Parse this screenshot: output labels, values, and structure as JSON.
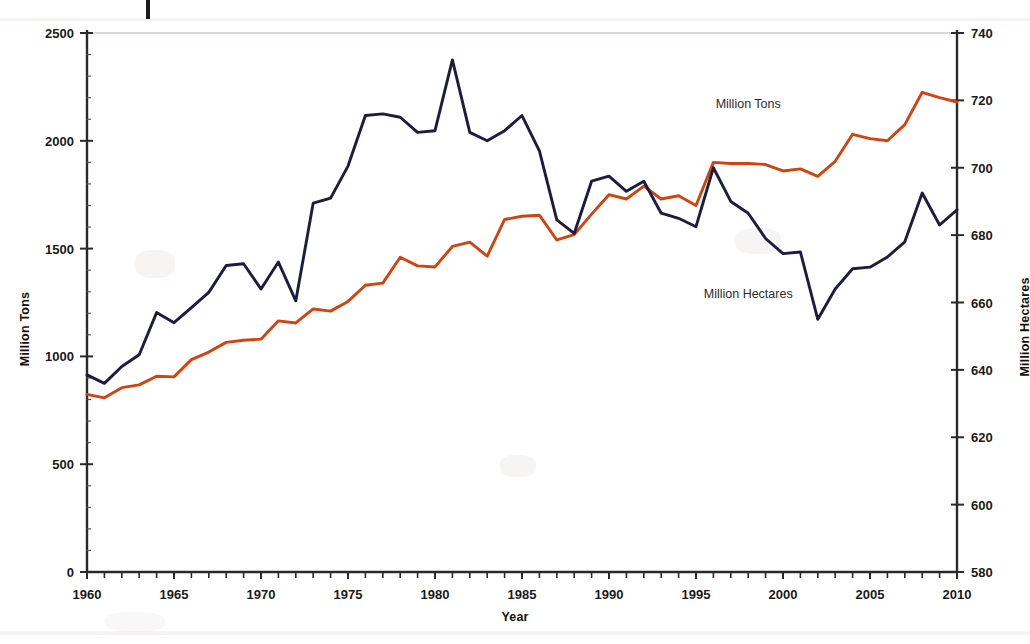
{
  "figure": {
    "background": "#ffffff",
    "artifact_mark": "vertical-scan-tick",
    "xlabel": "Year",
    "ylabel_left": "Million Tons",
    "ylabel_right": "Million Hectares"
  },
  "chart_data": {
    "type": "line",
    "title": "",
    "xlabel": "Year",
    "grid": false,
    "legend_position": "inline-annotations",
    "x": [
      1960,
      1961,
      1962,
      1963,
      1964,
      1965,
      1966,
      1967,
      1968,
      1969,
      1970,
      1971,
      1972,
      1973,
      1974,
      1975,
      1976,
      1977,
      1978,
      1979,
      1980,
      1981,
      1982,
      1983,
      1984,
      1985,
      1986,
      1987,
      1988,
      1989,
      1990,
      1991,
      1992,
      1993,
      1994,
      1995,
      1996,
      1997,
      1998,
      1999,
      2000,
      2001,
      2002,
      2003,
      2004,
      2005,
      2006,
      2007,
      2008,
      2009,
      2010
    ],
    "axes": [
      {
        "id": "left",
        "label": "Million Tons",
        "ylim": [
          0,
          2500
        ],
        "ticks": [
          0,
          500,
          1000,
          1500,
          2000,
          2500
        ],
        "side": "left"
      },
      {
        "id": "right",
        "label": "Million Hectares",
        "ylim": [
          580,
          740
        ],
        "ticks": [
          580,
          600,
          620,
          640,
          660,
          680,
          700,
          720,
          740
        ],
        "side": "right"
      }
    ],
    "xticks": [
      1960,
      1965,
      1970,
      1975,
      1980,
      1985,
      1990,
      1995,
      2000,
      2005,
      2010
    ],
    "xlim": [
      1960,
      2010
    ],
    "series": [
      {
        "name": "Million Tons",
        "axis": "left",
        "color": "#d2430f",
        "annotation": "Million Tons",
        "annotation_xy": [
          1998,
          2150
        ],
        "values": [
          824,
          808,
          855,
          868,
          908,
          905,
          985,
          1020,
          1065,
          1075,
          1080,
          1165,
          1155,
          1220,
          1210,
          1255,
          1330,
          1340,
          1460,
          1420,
          1415,
          1510,
          1530,
          1465,
          1635,
          1650,
          1655,
          1540,
          1565,
          1660,
          1750,
          1730,
          1790,
          1730,
          1745,
          1700,
          1900,
          1895,
          1895,
          1890,
          1860,
          1870,
          1835,
          1905,
          2030,
          2010,
          2000,
          2075,
          2225,
          2200,
          2180
        ]
      },
      {
        "name": "Million Hectares",
        "axis": "right",
        "color": "#1c1c40",
        "annotation": "Million Hectares",
        "annotation_xy": [
          1998,
          1270
        ],
        "values": [
          638.5,
          636.0,
          641.0,
          644.5,
          657.0,
          654.0,
          658.5,
          663.0,
          671.0,
          671.5,
          664.0,
          672.0,
          660.5,
          689.5,
          691.0,
          700.5,
          715.5,
          716.0,
          715.0,
          710.5,
          711.0,
          732.0,
          710.5,
          708.0,
          711.0,
          715.5,
          705.0,
          684.5,
          680.5,
          696.0,
          697.5,
          693.0,
          696.0,
          686.5,
          685.0,
          682.5,
          700.0,
          690.0,
          686.5,
          679.0,
          674.5,
          675.0,
          655.0,
          664.0,
          670.0,
          670.5,
          673.5,
          678.0,
          692.5,
          683.0,
          687.5
        ]
      }
    ]
  },
  "annotations": {
    "tons_label": "Million Tons",
    "hectares_label": "Million Hectares"
  }
}
